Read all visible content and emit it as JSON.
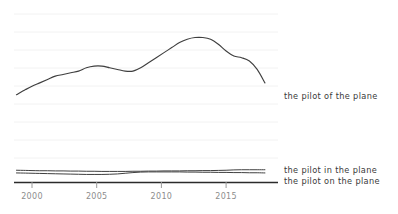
{
  "chart_data": {
    "type": "line",
    "title": "",
    "subtitle": "",
    "xlabel": "",
    "ylabel": "",
    "grid": true,
    "legend_position": "inline-right",
    "xlim": [
      1998.8,
      2018.0
    ],
    "ylim": [
      0,
      100
    ],
    "xticks": [
      2000,
      2005,
      2010,
      2015
    ],
    "xtick_labels": [
      "2000",
      "2005",
      "2010",
      "2015"
    ],
    "gridline_count": 9,
    "colors": {
      "line": "#3f3f3f",
      "gridline": "#f2f2f2",
      "axis": "#2b2b2b",
      "tick_text": "#8d8d8d",
      "label_text": "#3a3a3a",
      "background": "#ffffff"
    },
    "x": [
      1998.8,
      1999.5,
      2000.0,
      2000.6,
      2001.2,
      2001.8,
      2002.4,
      2003.0,
      2003.6,
      2004.2,
      2004.8,
      2005.4,
      2006.0,
      2006.6,
      2007.2,
      2007.8,
      2008.4,
      2009.0,
      2009.6,
      2010.2,
      2010.8,
      2011.4,
      2012.0,
      2012.6,
      2013.2,
      2013.8,
      2014.4,
      2015.0,
      2015.6,
      2016.2,
      2016.8,
      2017.4,
      2018.0
    ],
    "series": [
      {
        "name": "the pilot of the plane",
        "label": "the pilot of the plane",
        "values": [
          52,
          55,
          57,
          59,
          61,
          63,
          64,
          65,
          66,
          68,
          69,
          69,
          68,
          67,
          66,
          66,
          68,
          71,
          74,
          77,
          80,
          83,
          85,
          86,
          86,
          85,
          82,
          78,
          75,
          74,
          72,
          67,
          59
        ],
        "label_y": 96
      },
      {
        "name": "the pilot in the plane",
        "label": "the pilot in the plane",
        "values": [
          7.0,
          6.9,
          6.8,
          6.7,
          6.7,
          6.6,
          6.6,
          6.5,
          6.5,
          6.4,
          6.4,
          6.3,
          6.3,
          6.3,
          6.3,
          6.4,
          6.4,
          6.5,
          6.5,
          6.6,
          6.6,
          6.6,
          6.7,
          6.7,
          6.8,
          6.8,
          6.9,
          7.0,
          7.2,
          7.3,
          7.3,
          7.3,
          7.3
        ],
        "label_y": 170
      },
      {
        "name": "the pilot on the plane",
        "label": "the pilot on the plane",
        "values": [
          5.4,
          5.3,
          5.2,
          5.1,
          5.0,
          4.9,
          4.8,
          4.7,
          4.6,
          4.5,
          4.5,
          4.5,
          4.6,
          4.8,
          5.2,
          5.6,
          5.9,
          6.0,
          6.0,
          6.0,
          6.0,
          6.0,
          5.9,
          5.9,
          5.8,
          5.8,
          5.7,
          5.7,
          5.6,
          5.6,
          5.5,
          5.5,
          5.4
        ],
        "label_y": 181
      }
    ]
  },
  "labels": {
    "series_0": "the pilot of the plane",
    "series_1": "the pilot in the plane",
    "series_2": "the pilot on the plane"
  },
  "axis": {
    "tick_0": "2000",
    "tick_1": "2005",
    "tick_2": "2010",
    "tick_3": "2015"
  }
}
